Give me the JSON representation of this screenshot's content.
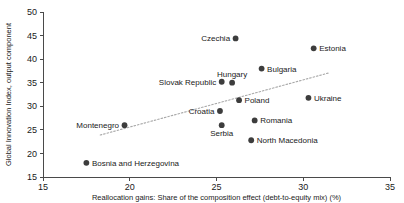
{
  "chart_data": {
    "type": "scatter",
    "title": "",
    "xlabel": "Reallocation gains: Share of the composition effect (debt-to-equity mix) (%)",
    "ylabel": "Global Innovation Index, output component",
    "xlim": [
      15,
      35
    ],
    "ylim": [
      15,
      50
    ],
    "xticks": [
      15,
      20,
      25,
      30,
      35
    ],
    "yticks": [
      15,
      20,
      25,
      30,
      35,
      40,
      45,
      50
    ],
    "grid": false,
    "legend": "none",
    "trendline": {
      "visible": true,
      "style": "dotted",
      "x": [
        18.3,
        31.5
      ],
      "y": [
        23.9,
        37.1
      ]
    },
    "points": [
      {
        "label": "Czechia",
        "x": 26.1,
        "y": 44.4,
        "label_pos": "left"
      },
      {
        "label": "Estonia",
        "x": 30.6,
        "y": 42.3,
        "label_pos": "right"
      },
      {
        "label": "Bulgaria",
        "x": 27.6,
        "y": 38.0,
        "label_pos": "right"
      },
      {
        "label": "Hungary",
        "x": 25.9,
        "y": 35.0,
        "label_pos": "above"
      },
      {
        "label": "Slovak Republic",
        "x": 25.3,
        "y": 35.2,
        "label_pos": "left"
      },
      {
        "label": "Ukraine",
        "x": 30.3,
        "y": 31.8,
        "label_pos": "right"
      },
      {
        "label": "Poland",
        "x": 26.3,
        "y": 31.3,
        "label_pos": "right"
      },
      {
        "label": "Croatia",
        "x": 25.2,
        "y": 29.0,
        "label_pos": "left"
      },
      {
        "label": "Romania",
        "x": 27.2,
        "y": 27.0,
        "label_pos": "right"
      },
      {
        "label": "Serbia",
        "x": 25.3,
        "y": 26.0,
        "label_pos": "below"
      },
      {
        "label": "Montenegro",
        "x": 19.7,
        "y": 26.0,
        "label_pos": "left"
      },
      {
        "label": "North Macedonia",
        "x": 27.0,
        "y": 22.8,
        "label_pos": "right"
      },
      {
        "label": "Bosnia and Herzegovina",
        "x": 17.5,
        "y": 18.0,
        "label_pos": "right"
      }
    ]
  }
}
